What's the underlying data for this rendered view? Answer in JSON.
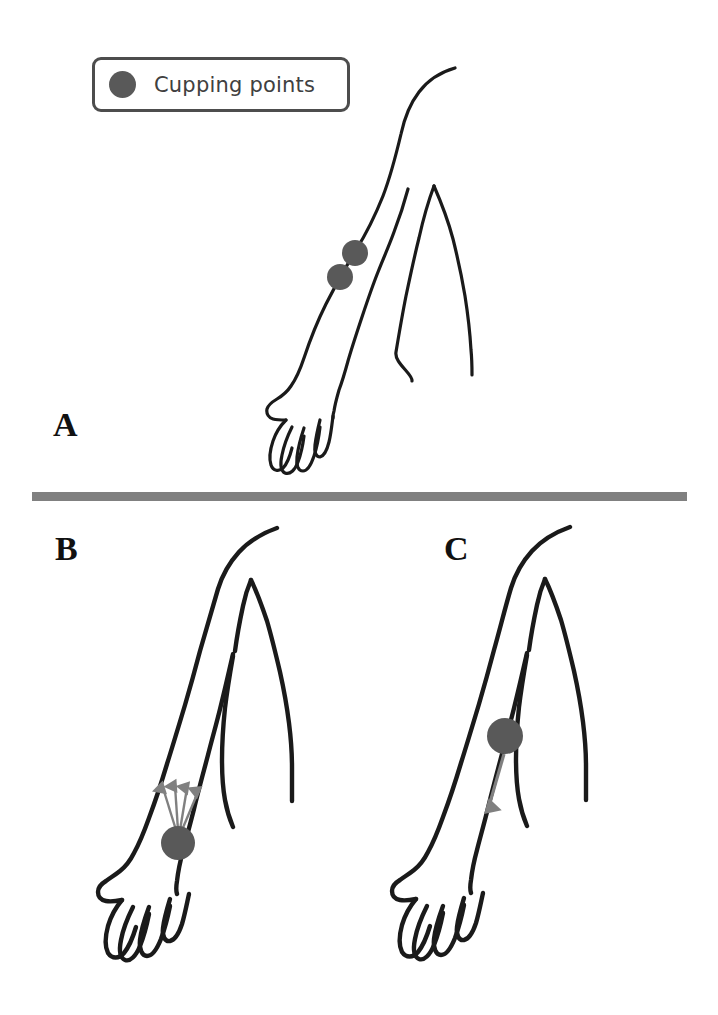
{
  "figure": {
    "width": 718,
    "height": 1015,
    "background_color": "#ffffff"
  },
  "legend": {
    "label": "Cupping points",
    "swatch_icon": "filled-circle-icon",
    "swatch_color": "#595959",
    "border_color": "#4d4d4d",
    "background_color": "#ffffff"
  },
  "divider": {
    "color": "#808080",
    "name": "horizontal-divider-bar"
  },
  "panels": [
    {
      "id": "A",
      "letter": "A",
      "description": "Right arm hanging down with two cupping points on the upper forearm near the elbow crease",
      "marker_count": 2,
      "arrow_count": 0,
      "markers": [
        {
          "cx": 355,
          "cy": 253,
          "r": 13,
          "color": "#595959"
        },
        {
          "cx": 340,
          "cy": 277,
          "r": 13,
          "color": "#595959"
        }
      ],
      "arrows": []
    },
    {
      "id": "B",
      "letter": "B",
      "description": "Arm with one cupping point near the wrist and four short arrows fanning upward away from the point",
      "marker_count": 1,
      "arrow_count": 4,
      "markers": [
        {
          "cx": 178,
          "cy": 843,
          "r": 17,
          "color": "#595959"
        }
      ],
      "arrows": [
        {
          "x1": 176,
          "y1": 833,
          "x2": 164,
          "y2": 785,
          "color": "#808080",
          "direction": "up"
        },
        {
          "x1": 178,
          "y1": 833,
          "x2": 176,
          "y2": 783,
          "color": "#808080",
          "direction": "up"
        },
        {
          "x1": 180,
          "y1": 833,
          "x2": 188,
          "y2": 785,
          "color": "#808080",
          "direction": "up"
        },
        {
          "x1": 182,
          "y1": 833,
          "x2": 199,
          "y2": 789,
          "color": "#808080",
          "direction": "up"
        }
      ]
    },
    {
      "id": "C",
      "letter": "C",
      "description": "Arm with one cupping point mid-forearm and a single long arrow pointing down toward the wrist",
      "marker_count": 1,
      "arrow_count": 1,
      "markers": [
        {
          "cx": 505,
          "cy": 736,
          "r": 18,
          "color": "#595959"
        }
      ],
      "arrows": [
        {
          "x1": 503,
          "y1": 752,
          "x2": 486,
          "y2": 812,
          "color": "#808080",
          "direction": "down"
        }
      ]
    }
  ],
  "colors": {
    "outline": "#1a1a1a",
    "marker": "#595959",
    "arrow": "#808080",
    "divider": "#808080",
    "text": "#111111",
    "legend_text": "#404040"
  }
}
